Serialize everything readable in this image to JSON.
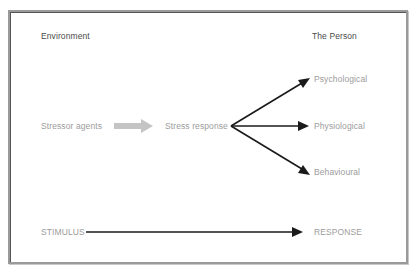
{
  "diagram": {
    "headers": {
      "left": "Environment",
      "right": "The Person"
    },
    "nodes": {
      "stressor": "Stressor agents",
      "stress_response": "Stress response",
      "outcomes": [
        {
          "label": "Psychological"
        },
        {
          "label": "Physiological"
        },
        {
          "label": "Behavioural"
        }
      ],
      "stimulus": "STIMULUS",
      "response": "RESPONSE"
    },
    "edges": [
      {
        "from": "Stressor agents",
        "to": "Stress response",
        "style": "gray block arrow"
      },
      {
        "from": "Stress response",
        "to": "Psychological",
        "style": "black arrow"
      },
      {
        "from": "Stress response",
        "to": "Physiological",
        "style": "black arrow"
      },
      {
        "from": "Stress response",
        "to": "Behavioural",
        "style": "black arrow"
      },
      {
        "from": "STIMULUS",
        "to": "RESPONSE",
        "style": "black arrow"
      }
    ],
    "colors": {
      "frame": "#9a9a9a",
      "text_light": "#9c9c9c",
      "text_header": "#4a4a4a",
      "arrow": "#1a1a1a",
      "block_arrow": "#c4c4c4"
    }
  }
}
